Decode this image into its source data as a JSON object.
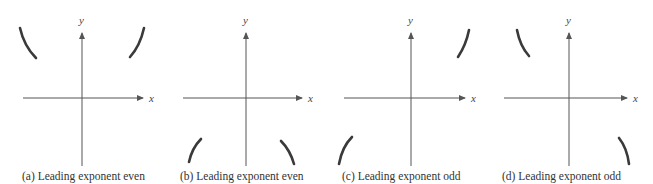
{
  "figure": {
    "axis_labels": {
      "x": "x",
      "y": "y"
    },
    "panels": [
      {
        "id": "a",
        "caption": "(a)  Leading exponent even",
        "left_end": "up",
        "right_end": "up"
      },
      {
        "id": "b",
        "caption": "(b)  Leading exponent even",
        "left_end": "down",
        "right_end": "down"
      },
      {
        "id": "c",
        "caption": "(c)  Leading exponent odd",
        "left_end": "down",
        "right_end": "up"
      },
      {
        "id": "d",
        "caption": "(d)  Leading exponent odd",
        "left_end": "up",
        "right_end": "down"
      }
    ],
    "colors": {
      "axis": "#555555",
      "curve": "#3a3a3a",
      "text": "#333333"
    }
  }
}
